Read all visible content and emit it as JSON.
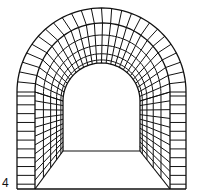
{
  "figure": {
    "label": "4",
    "stroke_color": "#111111",
    "background": "#ffffff",
    "arch_voussoir_count": 26,
    "wall_course_count": 11,
    "depth_rings": 5
  }
}
